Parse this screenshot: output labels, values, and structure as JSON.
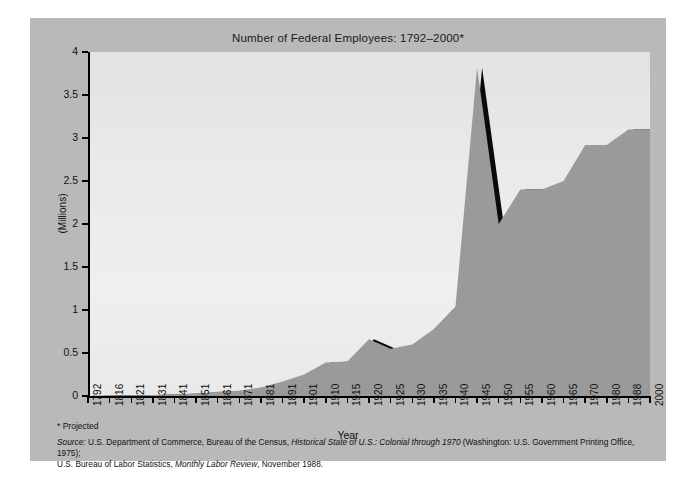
{
  "chart_data": {
    "type": "area",
    "title": "Number of Federal Employees: 1792–2000*",
    "xlabel": "Year",
    "ylabel": "(Millions)",
    "ylim": [
      0,
      4
    ],
    "yticks": [
      "0",
      "0.5",
      "1",
      "1.5",
      "2",
      "2.5",
      "3",
      "3.5",
      "4"
    ],
    "ytick_values": [
      0,
      0.5,
      1,
      1.5,
      2,
      2.5,
      3,
      3.5,
      4
    ],
    "categories": [
      "1792",
      "1816",
      "1821",
      "1831",
      "1841",
      "1851",
      "1861",
      "1871",
      "1881",
      "1891",
      "1901",
      "1910",
      "1915",
      "1920",
      "1925",
      "1930",
      "1935",
      "1940",
      "1945",
      "1950",
      "1955",
      "1960",
      "1965",
      "1970",
      "1980",
      "1988",
      "2000"
    ],
    "values": [
      0.0,
      0.005,
      0.007,
      0.012,
      0.02,
      0.03,
      0.05,
      0.06,
      0.1,
      0.17,
      0.25,
      0.39,
      0.4,
      0.66,
      0.55,
      0.6,
      0.78,
      1.04,
      3.82,
      2.0,
      2.4,
      2.4,
      2.5,
      2.92,
      2.92,
      3.1,
      3.1
    ],
    "grid": false,
    "legend": "none",
    "fill_color": "#9a9a9a",
    "shadow_color": "#0a0a0a",
    "plot_bg": "#eaeaea",
    "panel_bg": "#b9b9b9",
    "annotations": {
      "peak_year": "1945",
      "peak_value": "3.8",
      "projected_marker": "*"
    }
  },
  "footnotes": {
    "projected": "* Projected",
    "source_label": "Source:",
    "source_line1_a": " U.S. Department of Commerce, Bureau of the Census, ",
    "source_line1_italic": "Historical State of U.S.: Colonial through 1970",
    "source_line1_b": " (Washington: U.S. Government Printing Office, 1975);",
    "source_line2_a": "U.S. Bureau of Labor Statistics, ",
    "source_line2_italic": "Monthly Labor Review",
    "source_line2_b": ", November 1988."
  }
}
